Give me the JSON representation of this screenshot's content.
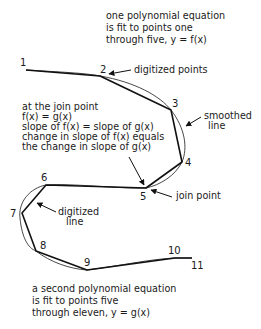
{
  "diagram": {
    "title_note": {
      "lines": [
        "one polynomial equation",
        "is fit to points one",
        "through five, y = f(x)"
      ]
    },
    "join_conditions": {
      "lines": [
        "at the join point",
        "f(x) = g(x)",
        "slope of f(x) = slope of g(x)",
        "change in slope of f(x) equals",
        "the change in slope of g(x)"
      ]
    },
    "bottom_note": {
      "lines": [
        "a second polynomial equation",
        "is fit to points five",
        "through eleven, y = g(x)"
      ]
    },
    "callouts": {
      "digitized_points": "digitized points",
      "smoothed_line": [
        "smoothed",
        "line"
      ],
      "join_point": "join point",
      "digitized_line": [
        "digitized",
        "line"
      ]
    },
    "points": [
      {
        "label": "1",
        "x": 26,
        "y": 70
      },
      {
        "label": "2",
        "x": 100,
        "y": 76
      },
      {
        "label": "3",
        "x": 171,
        "y": 110
      },
      {
        "label": "4",
        "x": 182,
        "y": 162
      },
      {
        "label": "5",
        "x": 146,
        "y": 188
      },
      {
        "label": "6",
        "x": 46,
        "y": 185
      },
      {
        "label": "7",
        "x": 22,
        "y": 213
      },
      {
        "label": "8",
        "x": 36,
        "y": 251
      },
      {
        "label": "9",
        "x": 87,
        "y": 270
      },
      {
        "label": "10",
        "x": 175,
        "y": 258
      },
      {
        "label": "11",
        "x": 192,
        "y": 258
      }
    ]
  }
}
